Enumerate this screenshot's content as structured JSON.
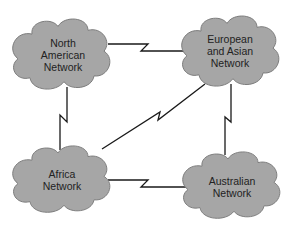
{
  "diagram": {
    "type": "network-topology",
    "colors": {
      "cloud_fill": "#a6a6a6",
      "cloud_stroke": "#7a7a7a",
      "link": "#1a1a1a",
      "background": "#ffffff"
    },
    "nodes": [
      {
        "id": "na",
        "label_lines": [
          "North",
          "American",
          "Network"
        ]
      },
      {
        "id": "eu",
        "label_lines": [
          "European",
          "and Asian",
          "Network"
        ]
      },
      {
        "id": "af",
        "label_lines": [
          "Africa",
          "Network"
        ]
      },
      {
        "id": "au",
        "label_lines": [
          "Australian",
          "Network"
        ]
      }
    ],
    "links": [
      {
        "from": "North American Network",
        "to": "European and Asian Network",
        "style": "WAN lightning bolt"
      },
      {
        "from": "North American Network",
        "to": "Africa Network",
        "style": "WAN lightning bolt"
      },
      {
        "from": "European and Asian Network",
        "to": "Australian Network",
        "style": "WAN lightning bolt"
      },
      {
        "from": "Africa Network",
        "to": "Australian Network",
        "style": "WAN lightning bolt"
      },
      {
        "from": "Africa Network",
        "to": "European and Asian Network",
        "style": "WAN lightning bolt"
      }
    ]
  }
}
